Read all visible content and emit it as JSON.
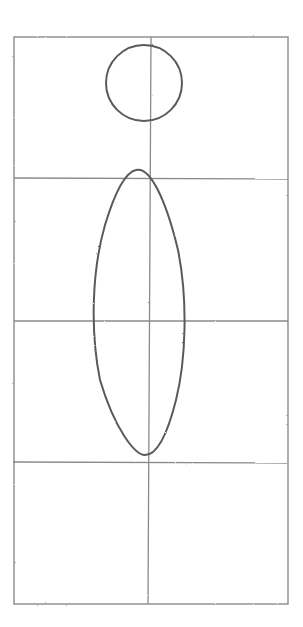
{
  "sketch": {
    "description": "Pencil sketch: figure construction grid with head circle and body ellipse",
    "colors": {
      "grid": "#8a8a8a",
      "shape": "#5a5a5a",
      "background": "#ffffff"
    },
    "frame": {
      "x": 14,
      "y": 37,
      "width": 274,
      "height": 567
    },
    "grid": {
      "rows": 4,
      "cols": 2,
      "h_lines_y": [
        178,
        321,
        462
      ],
      "v_line_x": 150
    },
    "head_circle": {
      "cx": 143,
      "cy": 84,
      "r": 38
    },
    "body_ellipse": {
      "cx": 140,
      "cy": 313,
      "rx": 46,
      "ry": 143
    }
  }
}
